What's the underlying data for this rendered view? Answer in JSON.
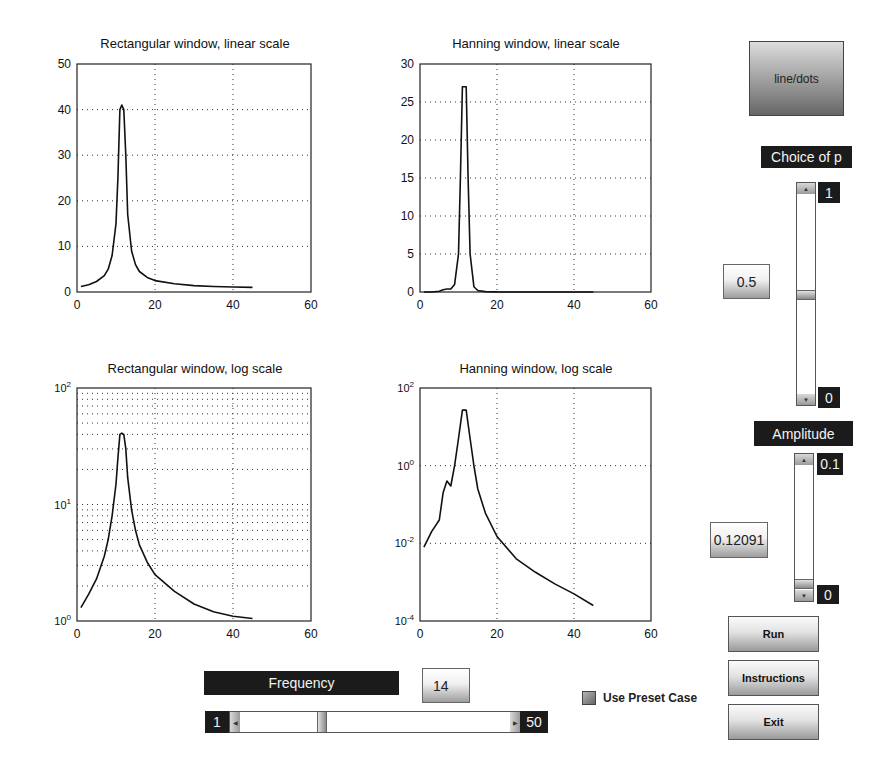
{
  "plots": [
    {
      "title": "Rectangular window, linear scale",
      "yscale": "linear",
      "xlim": [
        0,
        60
      ],
      "ylim": [
        0,
        50
      ],
      "xticks": [
        "0",
        "20",
        "40",
        "60"
      ],
      "yticks": [
        "0",
        "10",
        "20",
        "30",
        "40",
        "50"
      ]
    },
    {
      "title": "Hanning window, linear scale",
      "yscale": "linear",
      "xlim": [
        0,
        60
      ],
      "ylim": [
        0,
        30
      ],
      "xticks": [
        "0",
        "20",
        "40",
        "60"
      ],
      "yticks": [
        "0",
        "5",
        "10",
        "15",
        "20",
        "25",
        "30"
      ]
    },
    {
      "title": "Rectangular window, log scale",
      "yscale": "log",
      "xlim": [
        0,
        60
      ],
      "ylim": [
        1,
        100
      ],
      "xticks": [
        "0",
        "20",
        "40",
        "60"
      ],
      "yticks": [
        "10^0",
        "10^1",
        "10^2"
      ]
    },
    {
      "title": "Hanning window, log scale",
      "yscale": "log",
      "xlim": [
        0,
        60
      ],
      "ylim": [
        0.0001,
        100
      ],
      "xticks": [
        "0",
        "20",
        "40",
        "60"
      ],
      "yticks": [
        "10^-4",
        "10^-2",
        "10^0",
        "10^2"
      ]
    }
  ],
  "chart_data": [
    {
      "type": "line",
      "title": "Rectangular window, linear scale",
      "xlabel": "",
      "ylabel": "",
      "xlim": [
        0,
        60
      ],
      "ylim": [
        0,
        50
      ],
      "grid": true,
      "x": [
        1,
        3,
        5,
        7,
        8,
        9,
        10,
        10.5,
        11,
        11.5,
        12,
        12.5,
        13,
        14,
        15,
        16,
        18,
        20,
        25,
        30,
        35,
        40,
        45
      ],
      "y": [
        1.2,
        1.6,
        2.3,
        3.6,
        5,
        8,
        15,
        25,
        40,
        41,
        40,
        30,
        17,
        9,
        6,
        4.5,
        3.2,
        2.5,
        1.8,
        1.4,
        1.2,
        1.1,
        1.0
      ]
    },
    {
      "type": "line",
      "title": "Hanning window, linear scale",
      "xlabel": "",
      "ylabel": "",
      "xlim": [
        0,
        60
      ],
      "ylim": [
        0,
        30
      ],
      "grid": true,
      "x": [
        1,
        3,
        5,
        6,
        7,
        8,
        9,
        10,
        10.5,
        11,
        11.5,
        12,
        12.5,
        13,
        14,
        15,
        17,
        20,
        30,
        45
      ],
      "y": [
        0,
        0,
        0.1,
        0.3,
        0.4,
        0.4,
        1.0,
        5,
        15,
        27,
        27,
        27,
        15,
        5,
        0.7,
        0.2,
        0.05,
        0.01,
        0,
        0
      ]
    },
    {
      "type": "line",
      "title": "Rectangular window, log scale",
      "xlabel": "",
      "ylabel": "",
      "xlim": [
        0,
        60
      ],
      "ylim": [
        1,
        100
      ],
      "yscale": "log",
      "grid": true,
      "x": [
        1,
        3,
        5,
        7,
        8,
        9,
        10,
        10.5,
        11,
        11.5,
        12,
        12.5,
        13,
        14,
        15,
        16,
        18,
        20,
        25,
        30,
        35,
        40,
        45
      ],
      "y": [
        1.3,
        1.7,
        2.3,
        3.6,
        5,
        8,
        15,
        25,
        40,
        41,
        40,
        30,
        17,
        9,
        6,
        4.5,
        3.2,
        2.5,
        1.8,
        1.4,
        1.2,
        1.1,
        1.05
      ]
    },
    {
      "type": "line",
      "title": "Hanning window, log scale",
      "xlabel": "",
      "ylabel": "",
      "xlim": [
        0,
        60
      ],
      "ylim": [
        0.0001,
        100
      ],
      "yscale": "log",
      "grid": true,
      "x": [
        1,
        3,
        5,
        6,
        7,
        8,
        9,
        10,
        11,
        12,
        13,
        14,
        15,
        17,
        20,
        25,
        30,
        35,
        40,
        45
      ],
      "y": [
        0.008,
        0.02,
        0.04,
        0.2,
        0.4,
        0.3,
        1.0,
        5,
        27,
        27,
        5,
        1.0,
        0.25,
        0.06,
        0.015,
        0.004,
        0.0018,
        0.0009,
        0.0005,
        0.00025
      ]
    }
  ],
  "controls": {
    "line_dots_button": "line/dots",
    "choice_of_p": {
      "label": "Choice of p",
      "value": "0.5",
      "max_label": "1",
      "min_label": "0",
      "position": 0.5
    },
    "amplitude": {
      "label": "Amplitude",
      "value": "0.12091",
      "max_label": "0.1",
      "min_label": "0",
      "position": 0.05
    },
    "frequency": {
      "label": "Frequency",
      "value": "14",
      "min_label": "1",
      "max_label": "50",
      "position": 0.27
    },
    "use_preset_case": "Use Preset Case",
    "run_button": "Run",
    "instructions_button": "Instructions",
    "exit_button": "Exit"
  },
  "colors": {
    "line": "#111111",
    "label_bg": "#1b1b1b",
    "label_fg": "#f2f2f2",
    "grid": "#333333"
  }
}
